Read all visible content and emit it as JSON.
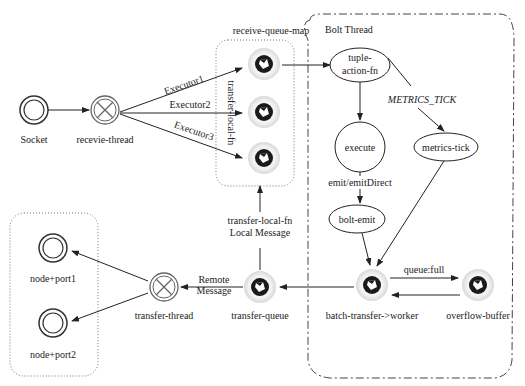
{
  "groups": {
    "receive_queue_map": "receive-queue-map",
    "bolt_thread": "Bolt Thread"
  },
  "nodes": {
    "socket": "Socket",
    "receive_thread": "recevie-thread",
    "tuple_action_fn_1": "tuple-",
    "tuple_action_fn_2": "action-fn",
    "execute": "execute",
    "metrics_tick": "metrics-tick",
    "bolt_emit": "bolt-emit",
    "batch_transfer": "batch-transfer->worker",
    "overflow_buffer": "overflow-buffer",
    "transfer_queue": "transfer-queue",
    "transfer_thread": "transfer-thread",
    "node_port1": "node+port1",
    "node_port2": "node+port2"
  },
  "edges": {
    "executor1": "Executor1",
    "executor2": "Executor2",
    "executor3": "Executor3",
    "transfer_local_fn_vertical": "transfer-local-fn",
    "metrics_tick_label": "METRICS_TICK",
    "emit_direct": "emit/emitDirect",
    "queue_full": "queue:full",
    "transfer_local_fn": "transfer-local-fn",
    "local_message": "Local Message",
    "remote": "Remote",
    "message": "Message"
  },
  "colors": {
    "stroke": "#222222",
    "queue_ring": "#e6e6e6",
    "queue_core": "#1a1a1a"
  }
}
